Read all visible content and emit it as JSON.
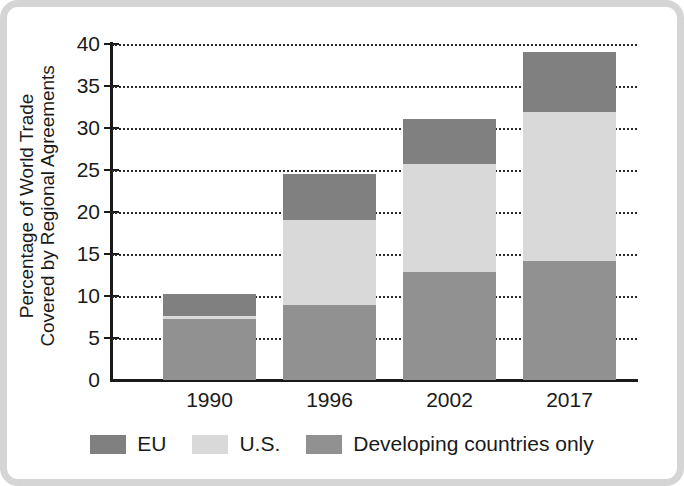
{
  "chart_data": {
    "type": "bar",
    "subtype": "stacked-bar",
    "title": "",
    "xlabel": "",
    "ylabel": "Percentage of World Trade Covered by Regional Agreements",
    "ylabel_lines": [
      "Percentage of World Trade",
      "Covered by Regional Agreements"
    ],
    "categories": [
      "1990",
      "1996",
      "2002",
      "2017"
    ],
    "ylim": [
      0,
      40
    ],
    "ytick_labels": [
      "0",
      "5",
      "10",
      "15",
      "20",
      "25",
      "30",
      "35",
      "40"
    ],
    "ytick_values": [
      0,
      5,
      10,
      15,
      20,
      25,
      30,
      35,
      40
    ],
    "grid": "horizontal-dotted",
    "legend_position": "bottom",
    "series": [
      {
        "name": "Developing countries only",
        "color": "#919191",
        "values": [
          7.3,
          8.9,
          12.8,
          14.2
        ]
      },
      {
        "name": "U.S.",
        "color": "#d9d9d9",
        "values": [
          0.3,
          10.1,
          12.9,
          17.7
        ]
      },
      {
        "name": "EU",
        "color": "#808080",
        "values": [
          2.6,
          5.5,
          5.4,
          7.1
        ]
      }
    ],
    "stack_order_bottom_to_top": [
      "Developing countries only",
      "U.S.",
      "EU"
    ],
    "totals": [
      10.2,
      24.5,
      31.1,
      39.0
    ]
  },
  "legend": {
    "items": [
      {
        "label": "EU",
        "color": "#808080",
        "swatch": "legend-swatch-eu"
      },
      {
        "label": "U.S.",
        "color": "#d9d9d9",
        "swatch": "legend-swatch-us"
      },
      {
        "label": "Developing countries only",
        "color": "#919191",
        "swatch": "legend-swatch-developing"
      }
    ]
  },
  "colors": {
    "eu": "#808080",
    "us": "#d9d9d9",
    "developing": "#919191",
    "axis": "#1a1a1a",
    "grid": "#2a2a2a",
    "frame": "#d5d5d5",
    "background": "#ffffff"
  }
}
